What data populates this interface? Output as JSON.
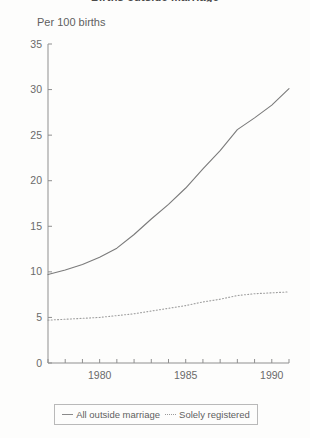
{
  "title_clipped": "Births outside marriage",
  "axis_unit_label": "Per 100 births",
  "legend": {
    "series1_label": "All outside marriage",
    "series2_label": "Solely registered"
  },
  "colors": {
    "background": "#fdfdfc",
    "axis": "#8f8f8f",
    "series1": "#7b7b7b",
    "series2": "#9e9e9e",
    "text": "#6a6a6a"
  },
  "chart_data": {
    "type": "line",
    "title": "Births outside marriage",
    "xlabel": "",
    "ylabel": "Per 100 births",
    "ylim": [
      0,
      35
    ],
    "xlim": [
      1977,
      1991
    ],
    "yticks": [
      0,
      5,
      10,
      15,
      20,
      25,
      30,
      35
    ],
    "ytick_labels": [
      "0",
      "5",
      "10",
      "15",
      "20",
      "25",
      "30",
      "35"
    ],
    "xticks": [
      1977,
      1978,
      1979,
      1980,
      1981,
      1982,
      1983,
      1984,
      1985,
      1986,
      1987,
      1988,
      1989,
      1990,
      1991
    ],
    "xtick_labels": [
      "",
      "",
      "",
      "1980",
      "",
      "",
      "",
      "",
      "1985",
      "",
      "",
      "",
      "",
      "1990",
      ""
    ],
    "grid": false,
    "legend_position": "bottom",
    "x": [
      1977,
      1978,
      1979,
      1980,
      1981,
      1982,
      1983,
      1984,
      1985,
      1986,
      1987,
      1988,
      1989,
      1990,
      1991
    ],
    "series": [
      {
        "name": "All outside marriage",
        "style": "solid",
        "values": [
          9.7,
          10.2,
          10.8,
          11.6,
          12.6,
          14.1,
          15.8,
          17.4,
          19.2,
          21.3,
          23.3,
          25.6,
          26.9,
          28.3,
          30.1
        ]
      },
      {
        "name": "Solely registered",
        "style": "dotted",
        "values": [
          4.7,
          4.8,
          4.9,
          5.0,
          5.2,
          5.4,
          5.7,
          6.0,
          6.3,
          6.7,
          7.0,
          7.4,
          7.6,
          7.7,
          7.8
        ]
      }
    ]
  }
}
